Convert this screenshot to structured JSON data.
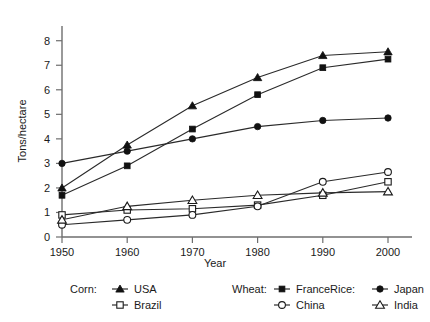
{
  "chart_data": {
    "type": "line",
    "title": "",
    "xlabel": "Year",
    "ylabel": "Tons/hectare",
    "x": [
      1950,
      1960,
      1970,
      1980,
      1990,
      2000
    ],
    "categories": [
      "1950",
      "1960",
      "1970",
      "1980",
      "1990",
      "2000"
    ],
    "xtick_labels": [
      "1950",
      "1960",
      "1970",
      "1980",
      "1990",
      "2000"
    ],
    "ytick_labels": [
      "0",
      "1",
      "2",
      "3",
      "4",
      "5",
      "6",
      "7",
      "8"
    ],
    "ytick_values": [
      0,
      1,
      2,
      3,
      4,
      5,
      6,
      7,
      8
    ],
    "xlim": [
      1950,
      2000
    ],
    "ylim": [
      0,
      8.6
    ],
    "grid": false,
    "legend_position": "below-axes",
    "series": [
      {
        "name": "USA",
        "group": "Corn",
        "marker": "filled-triangle",
        "values": [
          2.0,
          3.75,
          5.35,
          6.5,
          7.4,
          7.55
        ]
      },
      {
        "name": "Brazil",
        "group": "Corn",
        "marker": "open-square",
        "values": [
          0.9,
          1.1,
          1.15,
          1.3,
          1.7,
          2.25
        ]
      },
      {
        "name": "France",
        "group": "Wheat",
        "marker": "filled-square",
        "values": [
          1.7,
          2.9,
          4.4,
          5.8,
          6.9,
          7.25
        ]
      },
      {
        "name": "China",
        "group": "Wheat",
        "marker": "open-circle",
        "values": [
          0.5,
          0.7,
          0.9,
          1.25,
          2.25,
          2.65
        ]
      },
      {
        "name": "Japan",
        "group": "Rice",
        "marker": "filled-circle",
        "values": [
          3.0,
          3.5,
          4.0,
          4.5,
          4.75,
          4.85
        ]
      },
      {
        "name": "India",
        "group": "Rice",
        "marker": "open-triangle",
        "values": [
          0.7,
          1.25,
          1.5,
          1.7,
          1.8,
          1.85
        ]
      }
    ],
    "legend": {
      "groups": [
        {
          "label": "Corn:",
          "entries": [
            {
              "name": "USA",
              "marker": "filled-triangle"
            },
            {
              "name": "Brazil",
              "marker": "open-square"
            }
          ]
        },
        {
          "label": "Wheat:",
          "entries": [
            {
              "name": "France",
              "marker": "filled-square"
            },
            {
              "name": "China",
              "marker": "open-circle"
            }
          ]
        },
        {
          "label": "Rice:",
          "entries": [
            {
              "name": "Japan",
              "marker": "filled-circle"
            },
            {
              "name": "India",
              "marker": "open-triangle"
            }
          ]
        }
      ]
    },
    "colors": {
      "line": "#2a2a2a",
      "marker_fill": "#111111",
      "marker_open_fill": "#ffffff",
      "axis": "#6e6e6e",
      "text": "#1a1a1a",
      "background": "#ffffff"
    }
  }
}
